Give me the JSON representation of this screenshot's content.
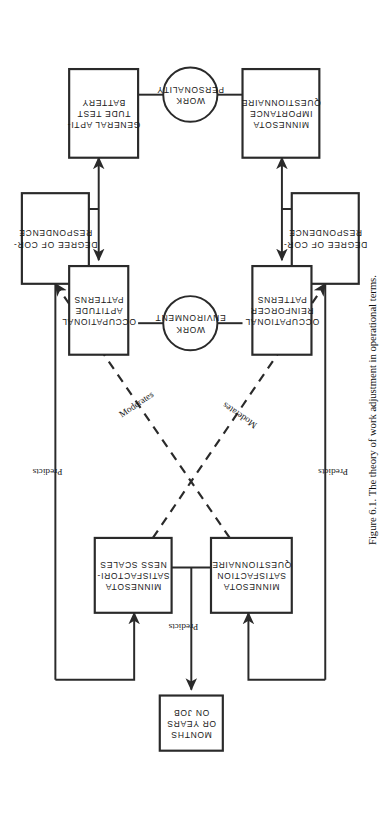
{
  "figure": {
    "caption": "Figure 6.1. The theory of work adjustment in operational terms.",
    "orientation": "rotated-90-ccw",
    "page_width": 386,
    "page_height": 818
  },
  "colors": {
    "ink": "#2a2a2a",
    "paper": "#ffffff",
    "text": "#1a1a1a"
  },
  "nodes": {
    "months_or_years_on_job": {
      "lines": [
        "MONTHS",
        "OR YEARS",
        "ON JOB"
      ],
      "shape": "box"
    },
    "minnesota_satisfactoriness_scales": {
      "lines": [
        "MINNESOTA",
        "SATISFACTORI-",
        "NESS SCALES"
      ],
      "shape": "box"
    },
    "minnesota_satisfaction_questionnaire": {
      "lines": [
        "MINNESOTA",
        "SATISFACTION",
        "QUESTIONNAIRE"
      ],
      "shape": "box"
    },
    "degree_of_correspondence_upper": {
      "lines": [
        "DEGREE OF COR-",
        "RESPONDENCE"
      ],
      "shape": "box"
    },
    "degree_of_correspondence_lower": {
      "lines": [
        "DEGREE OF COR-",
        "RESPONDENCE"
      ],
      "shape": "box"
    },
    "occupational_aptitude_patterns": {
      "lines": [
        "OCCUPATIONAL",
        "APTITUDE",
        "PATTERNS"
      ],
      "shape": "box"
    },
    "occupational_reinforcer_patterns": {
      "lines": [
        "OCCUPATIONAL",
        "REINFORCER",
        "PATTERNS"
      ],
      "shape": "box"
    },
    "work_environment": {
      "lines": [
        "WORK",
        "ENVIRONMENT"
      ],
      "shape": "circle"
    },
    "work_personality": {
      "lines": [
        "WORK",
        "PERSONALITY"
      ],
      "shape": "circle"
    },
    "general_aptitude_test_battery": {
      "lines": [
        "GENERAL APTI-",
        "TUDE TEST",
        "BATTERY"
      ],
      "shape": "box"
    },
    "minnesota_importance_questionnaire": {
      "lines": [
        "MINNESOTA",
        "IMPORTANCE",
        "QUESTIONNAIRE"
      ],
      "shape": "box"
    }
  },
  "edge_labels": {
    "predicts_center": "Predicts",
    "predicts_left": "Predicts",
    "predicts_right": "Predicts",
    "moderates_left": "Moderates",
    "moderates_right": "Moderates"
  }
}
